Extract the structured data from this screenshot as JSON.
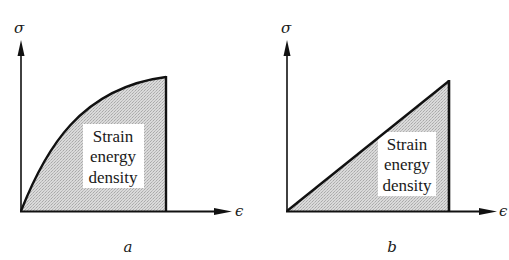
{
  "figure": {
    "panels": [
      {
        "id": "a",
        "panel_label": "a",
        "y_axis_label": "σ",
        "x_axis_label": "ϵ",
        "curve_type": "concave nonlinear",
        "region_label_lines": [
          "Strain",
          "energy",
          "density"
        ]
      },
      {
        "id": "b",
        "panel_label": "b",
        "y_axis_label": "σ",
        "x_axis_label": "ϵ",
        "curve_type": "linear",
        "region_label_lines": [
          "Strain",
          "energy",
          "density"
        ]
      }
    ],
    "colors": {
      "line": "#111111",
      "fill": "#d4d4d4",
      "text_bg": "#ffffff"
    }
  }
}
